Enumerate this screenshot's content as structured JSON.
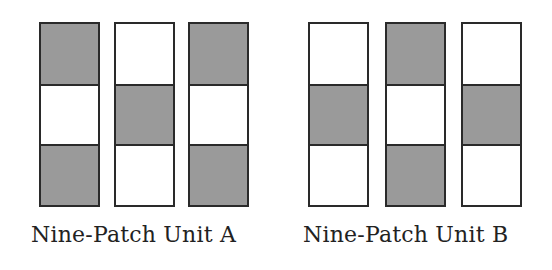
{
  "colors": {
    "dark": "#9a9a9a",
    "light": "#ffffff",
    "border": "#2a2a2a"
  },
  "units": [
    {
      "label": "Nine-Patch Unit A",
      "columns": [
        [
          "dark",
          "light",
          "dark"
        ],
        [
          "light",
          "dark",
          "light"
        ],
        [
          "dark",
          "light",
          "dark"
        ]
      ]
    },
    {
      "label": "Nine-Patch Unit B",
      "columns": [
        [
          "light",
          "dark",
          "light"
        ],
        [
          "dark",
          "light",
          "dark"
        ],
        [
          "light",
          "dark",
          "light"
        ]
      ]
    }
  ]
}
